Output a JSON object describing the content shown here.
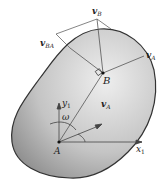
{
  "diagram": {
    "type": "rigid-body-velocity",
    "colors": {
      "body_fill_light": "#e6e6e6",
      "body_fill_dark": "#9a9a9a",
      "outline": "#333333",
      "lines": "#555555",
      "text": "#222222"
    },
    "labels": {
      "v_B": "v",
      "v_B_sub": "B",
      "v_BA": "v",
      "v_BA_sub": "BA",
      "v_A_top": "v",
      "v_A_top_sub": "A",
      "point_B": "B",
      "y_axis": "y",
      "y_axis_sub": "1",
      "omega": "ω",
      "v_A_bottom": "v",
      "v_A_bottom_sub": "A",
      "point_A": "A",
      "x_axis": "x",
      "x_axis_sub": "1"
    }
  }
}
